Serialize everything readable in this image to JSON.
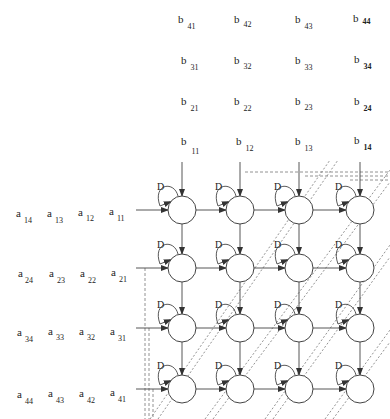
{
  "diagram": {
    "type": "systolic-array",
    "grid": {
      "rows": 4,
      "cols": 4
    },
    "node_centers_x": [
      182,
      240,
      299,
      360
    ],
    "node_centers_y": [
      210,
      268,
      328,
      389
    ],
    "node_radius": 14,
    "delay_label": "D",
    "colors": {
      "stroke": "#444444",
      "dashed": "#777777",
      "text": "#222222"
    }
  },
  "b_inputs": [
    [
      {
        "base": "b",
        "sub": "41"
      },
      {
        "base": "b",
        "sub": "42"
      },
      {
        "base": "b",
        "sub": "43"
      },
      {
        "base": "b",
        "sub": "44"
      }
    ],
    [
      {
        "base": "b",
        "sub": "31"
      },
      {
        "base": "b",
        "sub": "32"
      },
      {
        "base": "b",
        "sub": "33"
      },
      {
        "base": "b",
        "sub": "34"
      }
    ],
    [
      {
        "base": "b",
        "sub": "21"
      },
      {
        "base": "b",
        "sub": "22"
      },
      {
        "base": "b",
        "sub": "23"
      },
      {
        "base": "b",
        "sub": "24"
      }
    ],
    [
      {
        "base": "b",
        "sub": "11"
      },
      {
        "base": "b",
        "sub": "12"
      },
      {
        "base": "b",
        "sub": "13"
      },
      {
        "base": "b",
        "sub": "14"
      }
    ]
  ],
  "a_inputs": [
    [
      {
        "base": "a",
        "sub": "14"
      },
      {
        "base": "a",
        "sub": "13"
      },
      {
        "base": "a",
        "sub": "12"
      },
      {
        "base": "a",
        "sub": "11"
      }
    ],
    [
      {
        "base": "a",
        "sub": "24"
      },
      {
        "base": "a",
        "sub": "23"
      },
      {
        "base": "a",
        "sub": "22"
      },
      {
        "base": "a",
        "sub": "21"
      }
    ],
    [
      {
        "base": "a",
        "sub": "34"
      },
      {
        "base": "a",
        "sub": "33"
      },
      {
        "base": "a",
        "sub": "32"
      },
      {
        "base": "a",
        "sub": "31"
      }
    ],
    [
      {
        "base": "a",
        "sub": "44"
      },
      {
        "base": "a",
        "sub": "43"
      },
      {
        "base": "a",
        "sub": "42"
      },
      {
        "base": "a",
        "sub": "41"
      }
    ]
  ]
}
